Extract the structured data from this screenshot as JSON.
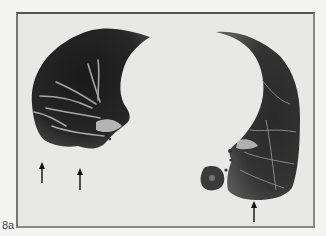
{
  "figure": {
    "label": "8a",
    "arrows": [
      {
        "x": 42,
        "y1": 163,
        "y2": 183
      },
      {
        "x": 80,
        "y1": 169,
        "y2": 190
      },
      {
        "x": 254,
        "y1": 202,
        "y2": 222
      }
    ]
  }
}
